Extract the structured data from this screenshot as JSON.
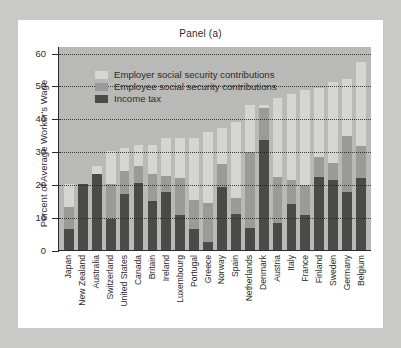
{
  "panel_title": "Panel (a)",
  "y_axis_label": "Percent of Average Worker's Wage",
  "legend": {
    "employer": "Employer social security contributions",
    "employee": "Employee social security contributions",
    "tax": "Income tax"
  },
  "colors": {
    "employer": "#d5d5d2",
    "employee": "#9a9a96",
    "tax": "#4a4a48",
    "plot_background": "#b9b9b7",
    "card_background": "#ffffff",
    "page_background": "#c9c9c7",
    "axis": "#2b2b2b"
  },
  "chart_data": {
    "type": "bar",
    "stacked": true,
    "title": "Panel (a)",
    "xlabel": "",
    "ylabel": "Percent of Average Worker's Wage",
    "ylim": [
      0,
      62
    ],
    "yticks": [
      0,
      10,
      20,
      30,
      40,
      50,
      60
    ],
    "ytick_labels": [
      "0",
      "10",
      "20",
      "30",
      "40",
      "50",
      "60"
    ],
    "grid": "horizontal-dotted",
    "legend_position": "upper-left-inside",
    "categories": [
      "Japan",
      "New Zealand",
      "Australia",
      "Switzerland",
      "United States",
      "Canada",
      "Britain",
      "Ireland",
      "Luxembourg",
      "Portugal",
      "Greece",
      "Norway",
      "Spain",
      "Netherlands",
      "Denmark",
      "Austria",
      "Italy",
      "France",
      "Finland",
      "Sweden",
      "Germany",
      "Belgium"
    ],
    "series": [
      {
        "name": "Income tax",
        "color": "#4a4a48",
        "values": [
          6.5,
          20.0,
          23.0,
          9.5,
          17.0,
          20.5,
          15.0,
          17.5,
          10.5,
          6.5,
          2.5,
          19.0,
          10.8,
          6.8,
          33.5,
          8.3,
          14.0,
          10.7,
          22.2,
          21.2,
          17.5,
          22.0
        ]
      },
      {
        "name": "Employee social security contributions",
        "color": "#9a9a96",
        "values": [
          6.5,
          0.0,
          0.0,
          10.5,
          7.0,
          5.0,
          8.0,
          5.0,
          11.3,
          8.8,
          11.7,
          7.2,
          5.0,
          23.0,
          9.7,
          14.0,
          7.2,
          9.2,
          6.2,
          5.2,
          17.2,
          9.5
        ]
      },
      {
        "name": "Employer social security contributions",
        "color": "#d5d5d2",
        "values": [
          7.0,
          0.0,
          2.5,
          10.0,
          7.0,
          6.5,
          9.0,
          11.5,
          12.2,
          18.7,
          21.8,
          11.0,
          23.2,
          14.2,
          1.0,
          24.0,
          26.3,
          28.6,
          20.9,
          24.6,
          17.3,
          25.5
        ]
      }
    ],
    "totals": [
      20.0,
      20.0,
      25.5,
      30.0,
      31.0,
      32.0,
      32.0,
      34.0,
      34.0,
      34.0,
      36.0,
      37.2,
      39.0,
      44.0,
      44.2,
      46.3,
      47.5,
      48.5,
      49.3,
      51.0,
      52.0,
      57.0
    ]
  }
}
